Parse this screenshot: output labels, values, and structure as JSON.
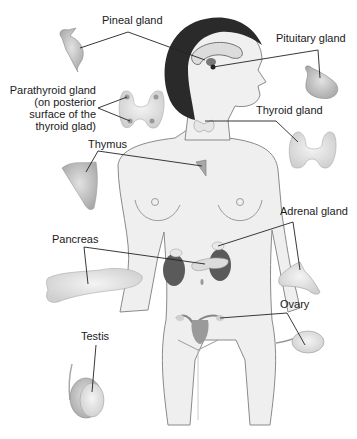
{
  "diagram": {
    "labels": {
      "pineal": "Pineal gland",
      "pituitary": "Pituitary gland",
      "parathyroid_line1": "Parathyroid gland",
      "parathyroid_line2": "(on posterior",
      "parathyroid_line3": "surface of the",
      "parathyroid_line4": "thyroid glad)",
      "thyroid": "Thyroid gland",
      "thymus": "Thymus",
      "adrenal": "Adrenal gland",
      "pancreas": "Pancreas",
      "ovary": "Ovary",
      "testis": "Testis"
    },
    "colors": {
      "background": "#ffffff",
      "skin": "#eeeeee",
      "outline": "#8a8a8a",
      "hair": "#2a2a2a",
      "gland": "#b8b8b8",
      "kidney": "#555555",
      "leader_line": "#222222"
    }
  }
}
